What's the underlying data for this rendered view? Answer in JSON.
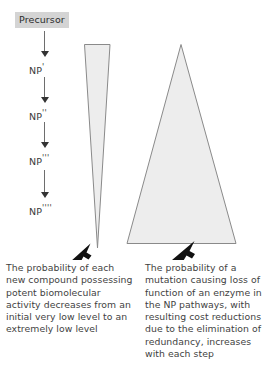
{
  "figure": {
    "background_color": "#ffffff",
    "text_color": "#3f3f3f",
    "triangle_fill": "#ededed",
    "triangle_stroke": "#8a8a8a",
    "arrow_color": "#333333",
    "box_fill": "#d4d4d4"
  },
  "pathway": {
    "precursor_label": "Precursor",
    "steps": [
      {
        "base": "NP",
        "primes": "'"
      },
      {
        "base": "NP",
        "primes": "''"
      },
      {
        "base": "NP",
        "primes": "'''"
      },
      {
        "base": "NP",
        "primes": "''''"
      }
    ],
    "arrow_count": 4
  },
  "triangles": {
    "left": {
      "name": "decreasing-probability-triangle",
      "orientation": "inverted",
      "description": "narrow wedge, wide at top tapering to a point at the bottom"
    },
    "right": {
      "name": "increasing-probability-triangle",
      "orientation": "upright",
      "description": "triangle with apex at top widening to a broad base at the bottom"
    }
  },
  "pointers": {
    "left_arrow_name": "left-pointer-arrow",
    "right_arrow_name": "right-pointer-arrow",
    "direction": "up-left"
  },
  "captions": {
    "left": "The probability of each new compound possessing potent biomolecular activity decreases from an initial very low level to an extremely low level",
    "right": "The probability of a mutation causing loss of function of an enzyme in the NP pathways, with resulting cost reductions due to the elimination of redundancy, increases with each step"
  }
}
